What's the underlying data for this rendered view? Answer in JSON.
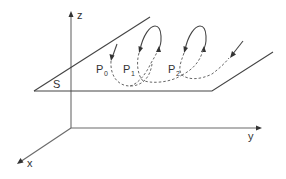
{
  "diagram": {
    "axes": {
      "x_label": "x",
      "y_label": "y",
      "z_label": "z"
    },
    "plane_label": "S",
    "points": [
      {
        "base": "P",
        "sub": "0"
      },
      {
        "base": "P",
        "sub": "1"
      },
      {
        "base": "P",
        "sub": "2"
      }
    ],
    "colors": {
      "line": "#444444",
      "axis": "#6a6a6a",
      "text": "#333333"
    }
  }
}
